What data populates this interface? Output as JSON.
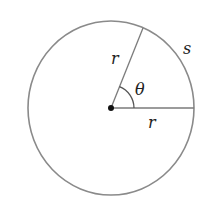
{
  "diagram": {
    "labels": {
      "radius_upper": "r",
      "radius_lower": "r",
      "angle": "θ",
      "arc": "s"
    },
    "colors": {
      "circle_stroke": "#8a8a8a",
      "line_stroke": "#7a7a7a",
      "center_dot": "#111111",
      "text": "#222222"
    }
  }
}
